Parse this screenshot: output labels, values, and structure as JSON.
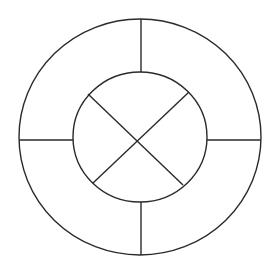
{
  "canvas": {
    "width": 277,
    "height": 270,
    "background": "#ffffff"
  },
  "style": {
    "stroke_color": "#2a2a2a",
    "stroke_width": 1.4
  },
  "diagram": {
    "outer_circle": {
      "cx": 140,
      "cy": 137,
      "rx": 121,
      "ry": 118
    },
    "inner_circle": {
      "cx": 140,
      "cy": 137,
      "rx": 67,
      "ry": 65
    },
    "ring_dividers": [
      {
        "name": "top",
        "x1": 141,
        "y1": 19,
        "x2": 141,
        "y2": 72
      },
      {
        "name": "right",
        "x1": 207,
        "y1": 140,
        "x2": 261,
        "y2": 140
      },
      {
        "name": "bottom",
        "x1": 141,
        "y1": 202,
        "x2": 141,
        "y2": 255
      },
      {
        "name": "left",
        "x1": 19,
        "y1": 140,
        "x2": 73,
        "y2": 140
      }
    ],
    "inner_diagonals": [
      {
        "name": "tl-br",
        "x1": 88,
        "y1": 94,
        "x2": 183,
        "y2": 185
      },
      {
        "name": "tr-bl",
        "x1": 189,
        "y1": 92,
        "x2": 93,
        "y2": 183
      }
    ]
  }
}
